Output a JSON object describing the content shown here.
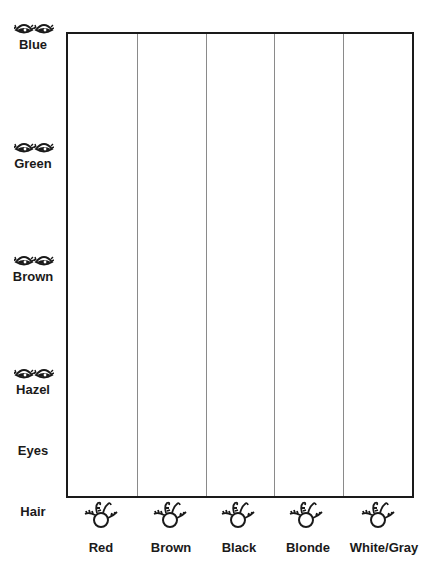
{
  "axis_labels": {
    "eyes": "Eyes",
    "hair": "Hair"
  },
  "eye_colors": [
    {
      "label": "Blue",
      "icon": "eyes-icon"
    },
    {
      "label": "Green",
      "icon": "eyes-icon"
    },
    {
      "label": "Brown",
      "icon": "eyes-icon"
    },
    {
      "label": "Hazel",
      "icon": "eyes-icon"
    }
  ],
  "hair_colors": [
    {
      "label": "Red",
      "icon": "hair-face-icon"
    },
    {
      "label": "Brown",
      "icon": "hair-face-icon"
    },
    {
      "label": "Black",
      "icon": "hair-face-icon"
    },
    {
      "label": "Blonde",
      "icon": "hair-face-icon"
    },
    {
      "label": "White/Gray",
      "icon": "hair-face-icon"
    }
  ],
  "colors": {
    "border": "#1a1a1a",
    "divider": "#8a8a8a",
    "background": "#ffffff"
  }
}
